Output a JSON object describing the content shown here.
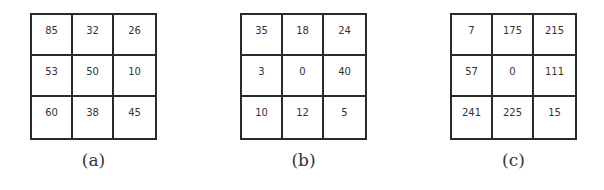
{
  "panels": [
    {
      "label": "(a)",
      "grid": [
        [
          "85",
          "32",
          "26"
        ],
        [
          "53",
          "50",
          "10"
        ],
        [
          "60",
          "38",
          "45"
        ]
      ]
    },
    {
      "label": "(b)",
      "grid": [
        [
          "35",
          "18",
          "24"
        ],
        [
          "3",
          "0",
          "40"
        ],
        [
          "10",
          "12",
          "5"
        ]
      ]
    },
    {
      "label": "(c)",
      "grid": [
        [
          "7",
          "175",
          "215"
        ],
        [
          "57",
          "0",
          "111"
        ],
        [
          "241",
          "225",
          "15"
        ]
      ]
    }
  ]
}
